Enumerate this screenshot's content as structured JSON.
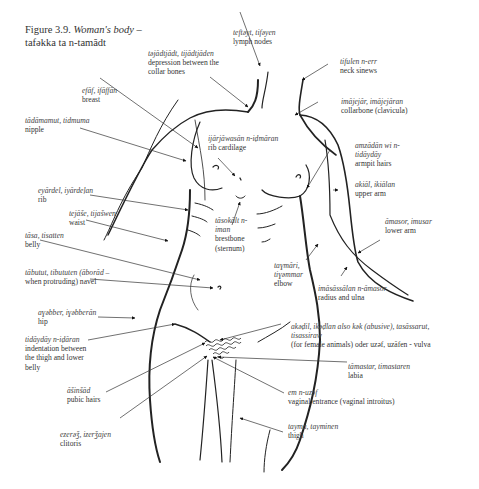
{
  "figure": {
    "number": "Figure 3.9.",
    "title_en": "Woman's body –",
    "title_tamasheq": "tafəkka ta n-tamădt"
  },
  "labels": [
    {
      "id": "lymph-nodes",
      "term": "teftəyt, tifəyen",
      "gloss": "lymph nodes"
    },
    {
      "id": "collar-depression",
      "term": "təjădtjădt, tijădtjăden",
      "gloss": "depression between the collar bones"
    },
    {
      "id": "neck-sinews",
      "term": "tifulen n-err",
      "gloss": "neck sinews"
    },
    {
      "id": "breast",
      "term": "efăf, ifăffăn",
      "gloss": "breast"
    },
    {
      "id": "collarbone",
      "term": "imăjejăr, imăjejăran",
      "gloss": "collarbone (clavicula)"
    },
    {
      "id": "nipple",
      "term": "tădămamut, tidmuma",
      "gloss": "nipple"
    },
    {
      "id": "rib-cartilage",
      "term": "ijărjăwasăn n-iḍmăran",
      "gloss": "rib cardilage"
    },
    {
      "id": "armpit-hairs",
      "term": "amzădăn wi n-tidăydăy",
      "gloss": "armpit hairs"
    },
    {
      "id": "rib",
      "term": "eyărdel, iyărdeḷan",
      "gloss": "rib"
    },
    {
      "id": "upper-arm",
      "term": "akiăl, ikiălan",
      "gloss": "upper arm"
    },
    {
      "id": "waist",
      "term": "tejăše, tijašwen",
      "gloss": "waist"
    },
    {
      "id": "sternum",
      "term": "tăsokălt n-iman",
      "gloss": "brestbone (sternum)"
    },
    {
      "id": "lower-arm",
      "term": "ămasor, imusar",
      "gloss": "lower arm"
    },
    {
      "id": "belly",
      "term": "tăsa, tisatten",
      "gloss": "belly"
    },
    {
      "id": "elbow",
      "term": "taɣmări, tiɣəmmar",
      "gloss": "elbow"
    },
    {
      "id": "navel",
      "term": "tăbutut, tibututen (ăborăd –",
      "gloss": "when protruding) navel"
    },
    {
      "id": "radius-ulna",
      "term": "imăsăssălan n-ămasor",
      "gloss": "radius and ulna"
    },
    {
      "id": "hip",
      "term": "aɣəbber, iɣəbberăn",
      "gloss": "hip"
    },
    {
      "id": "vulva",
      "term": "akəḍil, ikəḍlan also kǝk (abusive), tasăssarut, tisassiraw",
      "gloss": "(for female animals) oder uzəf, uzăfen - vulva"
    },
    {
      "id": "indentation",
      "term": "tidăydăy n-iḍăran",
      "gloss": "indentation between the thigh and lower belly"
    },
    {
      "id": "labia",
      "term": "tămastar, timastaren",
      "gloss": "labia"
    },
    {
      "id": "pubic-hairs",
      "term": "ăšinšăd",
      "gloss": "pubic hairs"
    },
    {
      "id": "vaginal-entrance",
      "term": "em n-uzəf",
      "gloss": "vaginal entrance (vaginal introitus)"
    },
    {
      "id": "clitoris",
      "term": "ezerǝǯ, izerǯajen",
      "gloss": "clitoris"
    },
    {
      "id": "thigh",
      "term": "tayma, tayminen",
      "gloss": "thigh"
    }
  ],
  "colors": {
    "ink": "#222222",
    "text": "#333333",
    "background": "#ffffff"
  }
}
